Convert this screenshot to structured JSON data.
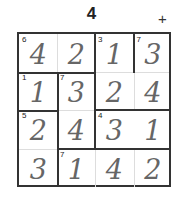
{
  "header": {
    "title": "4",
    "add_label": "+"
  },
  "puzzle": {
    "size": 4,
    "cells": [
      [
        {
          "v": "4",
          "cage": "6"
        },
        {
          "v": "2",
          "cage": ""
        },
        {
          "v": "1",
          "cage": "3"
        },
        {
          "v": "3",
          "cage": "7"
        }
      ],
      [
        {
          "v": "1",
          "cage": "1"
        },
        {
          "v": "3",
          "cage": "7"
        },
        {
          "v": "2",
          "cage": ""
        },
        {
          "v": "4",
          "cage": ""
        }
      ],
      [
        {
          "v": "2",
          "cage": "5"
        },
        {
          "v": "4",
          "cage": ""
        },
        {
          "v": "3",
          "cage": "4"
        },
        {
          "v": "1",
          "cage": ""
        }
      ],
      [
        {
          "v": "3",
          "cage": ""
        },
        {
          "v": "1",
          "cage": "7"
        },
        {
          "v": "4",
          "cage": ""
        },
        {
          "v": "2",
          "cage": ""
        }
      ]
    ]
  }
}
